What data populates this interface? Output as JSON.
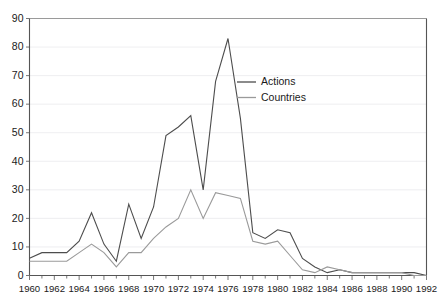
{
  "chart_data": {
    "type": "line",
    "title": "",
    "subtitle": "",
    "xlabel": "",
    "ylabel": "",
    "xlim": [
      1960,
      1992
    ],
    "ylim": [
      0,
      90
    ],
    "ytick_step": 10,
    "xtick_step": 2,
    "minor_xticks_every": 1,
    "grid": true,
    "grid_axis": "y",
    "legend_position": "inside-upper-right",
    "x": [
      1960,
      1961,
      1962,
      1963,
      1964,
      1965,
      1966,
      1967,
      1968,
      1969,
      1970,
      1971,
      1972,
      1973,
      1974,
      1975,
      1976,
      1977,
      1978,
      1979,
      1980,
      1981,
      1982,
      1983,
      1984,
      1985,
      1986,
      1987,
      1988,
      1989,
      1990,
      1991,
      1992
    ],
    "xtick_labels": [
      "1960",
      "1962",
      "1964",
      "1966",
      "1968",
      "1970",
      "1972",
      "1974",
      "1976",
      "1978",
      "1980",
      "1982",
      "1984",
      "1986",
      "1988",
      "1990",
      "1992"
    ],
    "ytick_labels": [
      "0",
      "10",
      "20",
      "30",
      "40",
      "50",
      "60",
      "70",
      "80",
      "90"
    ],
    "series": [
      {
        "name": "Actions",
        "color": "#4d4d4d",
        "values": [
          6,
          8,
          8,
          8,
          12,
          22,
          11,
          5,
          25,
          13,
          24,
          49,
          52,
          56,
          30,
          68,
          83,
          55,
          15,
          13,
          16,
          15,
          6,
          3,
          1,
          2,
          1,
          1,
          1,
          1,
          1,
          1,
          0
        ]
      },
      {
        "name": "Countries",
        "color": "#9a9a9a",
        "values": [
          5,
          5,
          5,
          5,
          8,
          11,
          8,
          3,
          8,
          8,
          13,
          17,
          20,
          30,
          20,
          29,
          28,
          27,
          12,
          11,
          12,
          7,
          2,
          1,
          3,
          2,
          1,
          1,
          1,
          1,
          1,
          0,
          0
        ]
      }
    ]
  },
  "legend": {
    "items": [
      {
        "label": "Actions"
      },
      {
        "label": "Countries"
      }
    ]
  }
}
